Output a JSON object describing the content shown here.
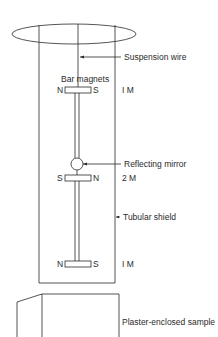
{
  "diagram": {
    "labels": {
      "suspension_wire": "Suspension wire",
      "bar_magnets": "Bar magnets",
      "reflecting_mirror": "Reflecting mirror",
      "tubular_shield": "Tubular shield",
      "sample": "Plaster-enclosed sample"
    },
    "magnets": [
      {
        "left_pole": "N",
        "right_pole": "S",
        "moment": "I M"
      },
      {
        "left_pole": "S",
        "right_pole": "N",
        "moment": "2 M"
      },
      {
        "left_pole": "N",
        "right_pole": "S",
        "moment": "I M"
      }
    ],
    "colors": {
      "line": "#2a2a2a",
      "background": "#ffffff"
    }
  }
}
